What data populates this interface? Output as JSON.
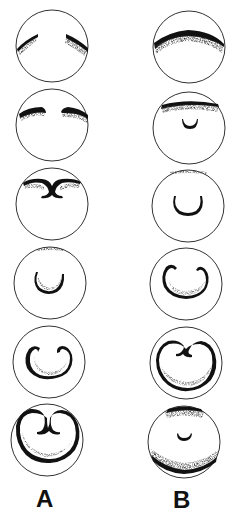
{
  "figure": {
    "columns": [
      {
        "label": "A",
        "stages": [
          {
            "index": 1,
            "feature": "two separated dark arcs near top"
          },
          {
            "index": 2,
            "feature": "two short dark arcs near top, slightly lower"
          },
          {
            "index": 3,
            "feature": "arcs joined at top center forming curled meeting point"
          },
          {
            "index": 4,
            "feature": "thin top band with small dark U-shaped crescent"
          },
          {
            "index": 5,
            "feature": "large dark horseshoe/kidney shape with curled tips"
          },
          {
            "index": 6,
            "feature": "large heart/kidney shape filling circle with curled center"
          }
        ]
      },
      {
        "label": "B",
        "stages": [
          {
            "index": 1,
            "feature": "broad dark cap band across top"
          },
          {
            "index": 2,
            "feature": "top band with small dark crescent below"
          },
          {
            "index": 3,
            "feature": "faint top band with U-shaped crescent"
          },
          {
            "index": 4,
            "feature": "large dark horseshoe with curled tips"
          },
          {
            "index": 5,
            "feature": "heart/kidney shape filling circle"
          },
          {
            "index": 6,
            "feature": "top and bottom dark bands with small crescent center"
          }
        ]
      }
    ]
  },
  "colors": {
    "ink": "#111111",
    "outline": "#333333",
    "background": "#ffffff"
  }
}
